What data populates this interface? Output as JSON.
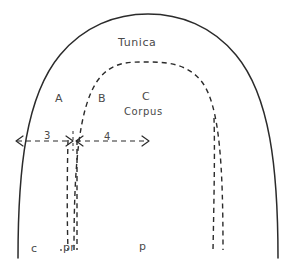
{
  "figure": {
    "title_label": "Tunica",
    "inner_label": "Corpus",
    "background_color": "#ffffff",
    "ink_color": "#2b2b2b",
    "text_color": "#4a4a4a",
    "width": 296,
    "height": 262,
    "zones": [
      {
        "id": "a",
        "label": "A"
      },
      {
        "id": "b",
        "label": "B"
      },
      {
        "id": "c",
        "label": "C"
      }
    ],
    "measures": [
      {
        "id": "m3",
        "label": "3",
        "style": "dashed-double-arrow"
      },
      {
        "id": "m4",
        "label": "4",
        "style": "dashed-double-arrow"
      }
    ],
    "base_labels": [
      {
        "id": "c",
        "label": "c"
      },
      {
        "id": "pr",
        "label": "pr"
      },
      {
        "id": "p",
        "label": "p"
      }
    ]
  }
}
